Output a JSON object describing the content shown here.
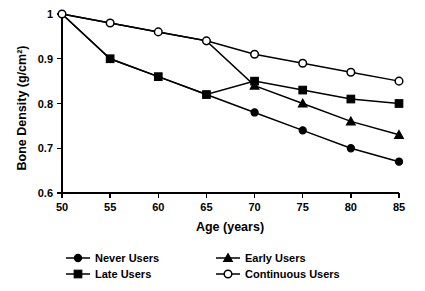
{
  "chart_data": {
    "type": "line",
    "title": "",
    "xlabel": "Age (years)",
    "ylabel": "Bone Density (g/cm²)",
    "x": [
      50,
      55,
      60,
      65,
      70,
      75,
      80,
      85
    ],
    "xlim": [
      50,
      85
    ],
    "ylim": [
      0.6,
      1.0
    ],
    "xticks": [
      "50",
      "55",
      "60",
      "65",
      "70",
      "75",
      "80",
      "85"
    ],
    "yticks": [
      "0.6",
      "0.7",
      "0.8",
      "0.9",
      "1"
    ],
    "grid": false,
    "legend_position": "bottom",
    "series": [
      {
        "name": "Never Users",
        "marker": "filled-circle",
        "values": [
          1.0,
          0.9,
          0.86,
          0.82,
          0.78,
          0.74,
          0.7,
          0.67
        ],
        "marker_points": [
          70,
          75,
          80,
          85
        ]
      },
      {
        "name": "Late Users",
        "marker": "filled-square",
        "values": [
          1.0,
          0.9,
          0.86,
          0.82,
          0.85,
          0.83,
          0.81,
          0.8
        ],
        "marker_points": [
          55,
          60,
          65,
          70,
          75,
          80,
          85
        ]
      },
      {
        "name": "Early Users",
        "marker": "filled-triangle",
        "values": [
          1.0,
          0.98,
          0.96,
          0.94,
          0.84,
          0.8,
          0.76,
          0.73
        ],
        "marker_points": [
          70,
          75,
          80,
          85
        ]
      },
      {
        "name": "Continuous Users",
        "marker": "open-circle",
        "values": [
          1.0,
          0.98,
          0.96,
          0.94,
          0.91,
          0.89,
          0.87,
          0.85
        ],
        "marker_points": [
          50,
          55,
          60,
          65,
          70,
          75,
          80,
          85
        ]
      }
    ]
  },
  "legend": {
    "entries": [
      {
        "label": "Never Users",
        "marker": "filled-circle"
      },
      {
        "label": "Early Users",
        "marker": "filled-triangle"
      },
      {
        "label": "Late Users",
        "marker": "filled-square"
      },
      {
        "label": "Continuous Users",
        "marker": "open-circle"
      }
    ]
  },
  "axes": {
    "x_title": "Age (years)",
    "y_title": "Bone Density (g/cm²)"
  },
  "colors": {
    "ink": "#000000",
    "background": "#ffffff"
  }
}
